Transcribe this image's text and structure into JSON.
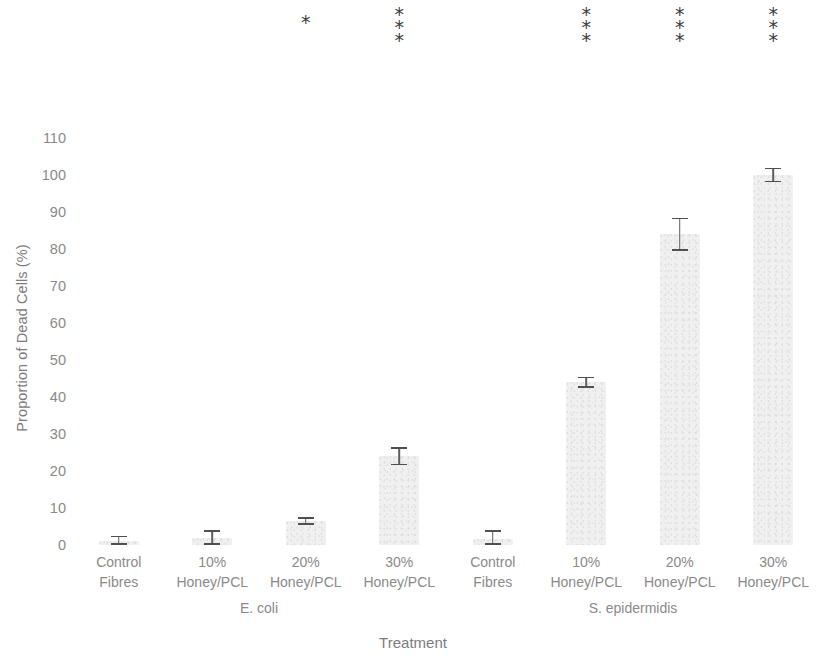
{
  "chart_data": {
    "type": "bar",
    "title": "",
    "xlabel": "Treatment",
    "ylabel": "Proportion of Dead Cells (%)",
    "ylim": [
      0,
      110
    ],
    "ytick_step": 10,
    "yticks": [
      "110",
      "100",
      "90",
      "80",
      "70",
      "60",
      "50",
      "40",
      "30",
      "20",
      "10",
      "0"
    ],
    "grid": false,
    "legend": "none",
    "bar_color": "#eeeeee",
    "error_color": "#555555",
    "categories": [
      "Control Fibres",
      "10% Honey/PCL",
      "20% Honey/PCL",
      "30% Honey/PCL",
      "Control Fibres",
      "10% Honey/PCL",
      "20% Honey/PCL",
      "30% Honey/PCL"
    ],
    "groups": [
      {
        "name": "E. coli",
        "start": 0,
        "end": 3
      },
      {
        "name": "S. epidermidis",
        "start": 4,
        "end": 7
      }
    ],
    "values": [
      1,
      2,
      6.5,
      24,
      1.5,
      44,
      84,
      100
    ],
    "errors": [
      1.5,
      2,
      1,
      2.5,
      2.5,
      1.5,
      4.5,
      2
    ],
    "bars": [
      {
        "label_line1": "Control",
        "label_line2": "Fibres",
        "value": 1,
        "error": 1.5,
        "group": "E. coli",
        "significance": ""
      },
      {
        "label_line1": "10%",
        "label_line2": "Honey/PCL",
        "value": 2,
        "error": 2,
        "group": "E. coli",
        "significance": ""
      },
      {
        "label_line1": "20%",
        "label_line2": "Honey/PCL",
        "value": 6.5,
        "error": 1,
        "group": "E. coli",
        "significance": "*"
      },
      {
        "label_line1": "30%",
        "label_line2": "Honey/PCL",
        "value": 24,
        "error": 2.5,
        "group": "E. coli",
        "significance": "***"
      },
      {
        "label_line1": "Control",
        "label_line2": "Fibres",
        "value": 1.5,
        "error": 2.5,
        "group": "S. epidermidis",
        "significance": ""
      },
      {
        "label_line1": "10%",
        "label_line2": "Honey/PCL",
        "value": 44,
        "error": 1.5,
        "group": "S. epidermidis",
        "significance": "***"
      },
      {
        "label_line1": "20%",
        "label_line2": "Honey/PCL",
        "value": 84,
        "error": 4.5,
        "group": "S. epidermidis",
        "significance": "***"
      },
      {
        "label_line1": "30%",
        "label_line2": "Honey/PCL",
        "value": 100,
        "error": 2,
        "group": "S. epidermidis",
        "significance": "***"
      }
    ],
    "significance_note": "Stars are drawn stacked vertically above the bar"
  }
}
